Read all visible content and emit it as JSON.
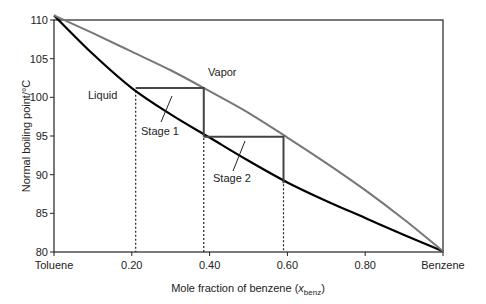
{
  "chart_data": {
    "type": "line",
    "title": "",
    "xlabel": "Mole fraction of benzene",
    "xlabel_var": "x",
    "xlabel_sub": "benz",
    "ylabel": "Normal boiling point/°C",
    "xlim": [
      0,
      1
    ],
    "ylim": [
      80,
      110
    ],
    "grid": false,
    "x_ticks": [
      {
        "value": 0,
        "label": "Toluene"
      },
      {
        "value": 0.2,
        "label": "0.20"
      },
      {
        "value": 0.4,
        "label": "0.40"
      },
      {
        "value": 0.6,
        "label": "0.60"
      },
      {
        "value": 0.8,
        "label": "0.80"
      },
      {
        "value": 1,
        "label": "Benzene"
      }
    ],
    "y_ticks": [
      {
        "value": 80,
        "label": "80"
      },
      {
        "value": 85,
        "label": "85"
      },
      {
        "value": 90,
        "label": "90"
      },
      {
        "value": 95,
        "label": "95"
      },
      {
        "value": 100,
        "label": "100"
      },
      {
        "value": 105,
        "label": "105"
      },
      {
        "value": 110,
        "label": "110"
      }
    ],
    "series": [
      {
        "name": "Liquid",
        "color": "#000000",
        "x": [
          0,
          0.1,
          0.2,
          0.3,
          0.4,
          0.5,
          0.6,
          0.7,
          0.8,
          0.9,
          1.0
        ],
        "y": [
          110.6,
          105.6,
          101.2,
          97.8,
          94.8,
          91.8,
          89.0,
          86.6,
          84.4,
          82.2,
          80.1
        ]
      },
      {
        "name": "Vapor",
        "color": "#777777",
        "x": [
          0,
          0.1,
          0.2,
          0.3,
          0.4,
          0.5,
          0.6,
          0.7,
          0.8,
          0.9,
          1.0
        ],
        "y": [
          110.6,
          108.3,
          105.9,
          103.5,
          100.8,
          98.0,
          94.8,
          91.5,
          88.0,
          84.2,
          80.1
        ]
      }
    ],
    "stages": [
      {
        "label": "Stage 1",
        "x_start": 0.21,
        "x_end": 0.385,
        "t_top": 101.2,
        "t_bottom": 94.9
      },
      {
        "label": "Stage 2",
        "x_start": 0.385,
        "x_end": 0.59,
        "t_top": 94.9,
        "t_bottom": 88.9
      }
    ],
    "dashed_verticals_x": [
      0.21,
      0.385,
      0.59
    ],
    "annotations": [
      {
        "text": "Liquid",
        "x": 0.13,
        "y": 101
      },
      {
        "text": "Vapor",
        "x": 0.46,
        "y": 102.5
      },
      {
        "text": "Stage 1",
        "x": 0.26,
        "y": 97
      },
      {
        "text": "Stage 2",
        "x": 0.46,
        "y": 91
      }
    ]
  }
}
